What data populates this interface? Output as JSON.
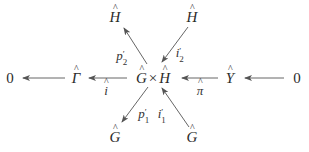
{
  "diagram": {
    "type": "commutative-diagram",
    "center": {
      "left": "G",
      "op": "×",
      "right": "H"
    },
    "nodes": {
      "zero_left": "0",
      "gamma_hat": "Γ",
      "center_label": "G × H",
      "y_hat": "Y",
      "zero_right": "0",
      "h_hat_top_left": "H",
      "h_hat_top_right": "H",
      "g_hat_bottom_left": "G",
      "g_hat_bottom_right": "G"
    },
    "arrows": [
      {
        "from": "Γ̂",
        "to": "0",
        "label": ""
      },
      {
        "from": "Ĝ × Ĥ",
        "to": "Γ̂",
        "label": "î"
      },
      {
        "from": "Ŷ",
        "to": "Ĝ × Ĥ",
        "label": "π̂"
      },
      {
        "from": "0",
        "to": "Ŷ",
        "label": ""
      },
      {
        "from": "Ĝ × Ĥ",
        "to": "Ĥ (top-left)",
        "label": "p′₂"
      },
      {
        "from": "Ĥ (top-right)",
        "to": "Ĝ × Ĥ",
        "label": "i′₂"
      },
      {
        "from": "Ĝ × Ĥ",
        "to": "Ĝ (bottom-left)",
        "label": "p′₁"
      },
      {
        "from": "Ĝ (bottom-right)",
        "to": "Ĝ × Ĥ",
        "label": "i′₁"
      }
    ],
    "labels": {
      "i_hat": "i",
      "pi_hat": "π",
      "p2_base": "p",
      "p2_sub": "2",
      "p2_prime": "′",
      "i2_base": "i",
      "i2_sub": "2",
      "i2_prime": "′",
      "p1_base": "p",
      "p1_sub": "1",
      "p1_prime": "′",
      "i1_base": "i",
      "i1_sub": "1",
      "i1_prime": "′"
    },
    "colors": {
      "ink": "#2b2b2b",
      "arrow": "#555555",
      "background": "#ffffff"
    }
  }
}
